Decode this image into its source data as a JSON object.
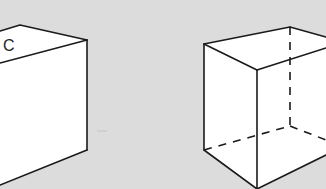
{
  "figure": {
    "background_color": "#dcdcdc",
    "line_color": "#1a1a1a",
    "face_color": "#ffffff"
  },
  "left_cube": {
    "label": "C",
    "style": "solid",
    "visible_edges_only": true
  },
  "right_cube": {
    "style": "wireframe",
    "hidden_edges": "dashed"
  }
}
